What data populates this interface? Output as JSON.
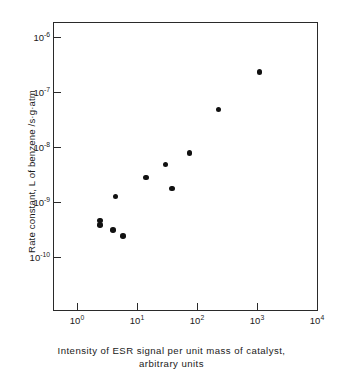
{
  "chart_data": {
    "type": "scatter",
    "title": "",
    "xlabel": "Intensity of  ESR  signal  per  unit  mass of  catalyst,  arbitrary  units",
    "xlabel_line1": "Intensity  of   ESR  signal  per  unit  mass  of  catalyst,",
    "xlabel_line2": "arbitrary  units",
    "ylabel": "Rate constant, L of benzene /s·g·atm",
    "xscale": "log",
    "yscale": "log",
    "xlim": [
      0.4,
      10000
    ],
    "ylim": [
      3e-11,
      3e-06
    ],
    "grid": false,
    "legend": null,
    "xticks": [
      1,
      10,
      100,
      1000,
      10000
    ],
    "xtick_labels": [
      "10",
      "10",
      "10",
      "10",
      "10"
    ],
    "xtick_exponents": [
      "0",
      "1",
      "2",
      "3",
      "4"
    ],
    "yticks": [
      1e-06,
      1e-07,
      1e-08,
      1e-09,
      1e-10
    ],
    "ytick_labels": [
      "10",
      "10",
      "10",
      "10",
      "10"
    ],
    "ytick_exponents": [
      "-6",
      "-7",
      "-8",
      "-9",
      "-10"
    ],
    "marker": "filled-circle",
    "marker_color": "#111111",
    "points": [
      {
        "x": 2.4,
        "y": 4.6e-10
      },
      {
        "x": 2.4,
        "y": 3.8e-10
      },
      {
        "x": 4.0,
        "y": 3.1e-10
      },
      {
        "x": 5.8,
        "y": 2.4e-10
      },
      {
        "x": 4.4,
        "y": 1.25e-09
      },
      {
        "x": 14.0,
        "y": 2.8e-09
      },
      {
        "x": 30.0,
        "y": 4.8e-09
      },
      {
        "x": 38.0,
        "y": 1.75e-09
      },
      {
        "x": 75.0,
        "y": 7.8e-09
      },
      {
        "x": 230.0,
        "y": 4.8e-08
      },
      {
        "x": 1100.0,
        "y": 2.3e-07
      }
    ]
  },
  "figure": {
    "background_color": "#ffffff",
    "axis_color": "#2a2a2a"
  }
}
